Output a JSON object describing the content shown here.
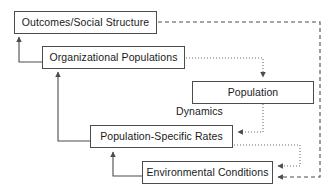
{
  "diagram": {
    "background_color": "#ffffff",
    "line_color": "#4c4c4c",
    "text_color": "#1a1a1a",
    "width": 334,
    "height": 191,
    "nodes": [
      {
        "id": "outcomes",
        "label": "Outcomes/Social Structure",
        "x": 14,
        "y": 11,
        "w": 143,
        "h": 23
      },
      {
        "id": "organizational_populations",
        "label": "Organizational Populations",
        "x": 42,
        "y": 46,
        "w": 143,
        "h": 23
      },
      {
        "id": "population",
        "label": "Population",
        "x": 192,
        "y": 81,
        "w": 122,
        "h": 23
      },
      {
        "id": "population_specific_rates",
        "label": "Population-Specific Rates",
        "x": 90,
        "y": 125,
        "w": 143,
        "h": 23
      },
      {
        "id": "environmental_conditions",
        "label": "Environmental Conditions",
        "x": 142,
        "y": 161,
        "w": 131,
        "h": 23
      }
    ],
    "free_labels": [
      {
        "id": "dynamics",
        "label": "Dynamics",
        "x": 176,
        "y": 106
      }
    ],
    "edges": [
      {
        "id": "org-to-outcomes",
        "from": "organizational_populations",
        "to": "outcomes",
        "style": "solid",
        "arrow": true
      },
      {
        "id": "rates-to-org",
        "from": "population_specific_rates",
        "to": "organizational_populations",
        "style": "solid",
        "arrow": true
      },
      {
        "id": "env-to-rates",
        "from": "environmental_conditions",
        "to": "population_specific_rates",
        "style": "solid",
        "arrow": true
      },
      {
        "id": "org-to-population",
        "from": "organizational_populations",
        "to": "population",
        "style": "dotted",
        "arrow": true
      },
      {
        "id": "population-to-rates",
        "from": "population",
        "to": "population_specific_rates",
        "style": "dotted",
        "arrow": true
      },
      {
        "id": "rates-to-env",
        "from": "population_specific_rates",
        "to": "environmental_conditions",
        "style": "dotted",
        "arrow": true
      },
      {
        "id": "outcomes-to-env",
        "from": "outcomes",
        "to": "environmental_conditions",
        "style": "dashed",
        "arrow": true
      }
    ]
  }
}
